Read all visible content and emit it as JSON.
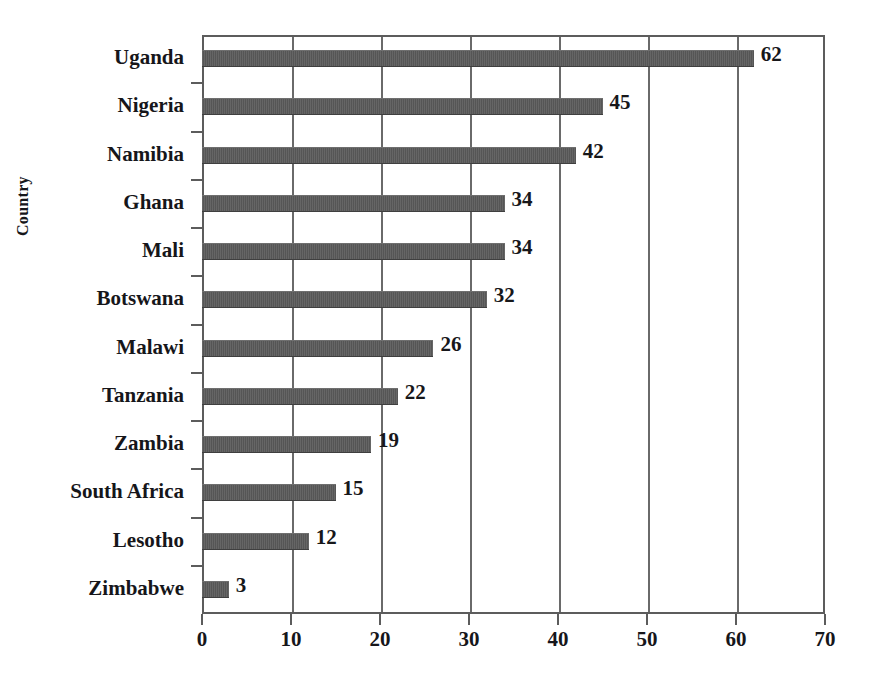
{
  "chart_data": {
    "type": "bar",
    "orientation": "horizontal",
    "title": "",
    "xlabel": "",
    "ylabel": "Country",
    "categories": [
      "Uganda",
      "Nigeria",
      "Namibia",
      "Ghana",
      "Mali",
      "Botswana",
      "Malawi",
      "Tanzania",
      "Zambia",
      "South Africa",
      "Lesotho",
      "Zimbabwe"
    ],
    "values": [
      62,
      45,
      42,
      34,
      34,
      32,
      26,
      22,
      19,
      15,
      12,
      3
    ],
    "data_labels": [
      "62",
      "45",
      "42",
      "34",
      "34",
      "32",
      "26",
      "22",
      "19",
      "15",
      "12",
      "3"
    ],
    "xlim": [
      0,
      70
    ],
    "xticks": [
      0,
      10,
      20,
      30,
      40,
      50,
      60,
      70
    ],
    "xtick_labels": [
      "0",
      "10",
      "20",
      "30",
      "40",
      "50",
      "60",
      "70"
    ],
    "grid": "vertical",
    "legend": "none",
    "bar_color": "#5a5a5a",
    "axis_color": "#5c5c5c",
    "text_color": "#16161a",
    "background": "#ffffff"
  },
  "artifacts": {
    "top_clipped_text": ""
  }
}
